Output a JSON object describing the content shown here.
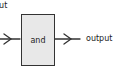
{
  "diagram": {
    "type": "logic-gate-block",
    "input_label": "input",
    "input_label_visible": "put",
    "gate_label": "and",
    "output_label": "output",
    "colors": {
      "box_fill": "#e8e8e8",
      "stroke": "#333333",
      "text": "#222222"
    }
  }
}
